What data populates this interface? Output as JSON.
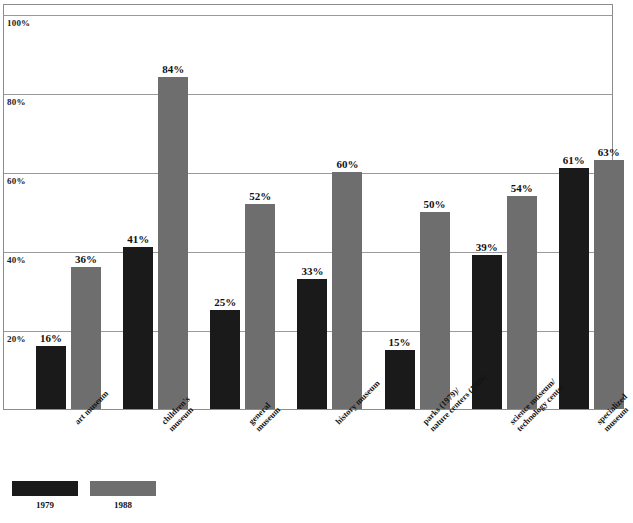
{
  "chart_data": {
    "type": "bar",
    "title": "",
    "xlabel": "",
    "ylabel": "",
    "ylim": [
      0,
      100
    ],
    "grid": true,
    "legend_position": "bottom-left",
    "y_ticks": [
      "20%",
      "40%",
      "60%",
      "80%",
      "100%"
    ],
    "y_tick_values": [
      20,
      40,
      60,
      80,
      100
    ],
    "categories": [
      "art museum",
      "children's\nmuseum",
      "general\nmuseum",
      "history museum",
      "parks (1979)/\nnature centers (1989)",
      "science museum/\ntechnology center",
      "specialized\nmuseum"
    ],
    "category_lines": [
      [
        "art museum"
      ],
      [
        "children's",
        "museum"
      ],
      [
        "general",
        "museum"
      ],
      [
        "history museum"
      ],
      [
        "parks (1979)/",
        "nature centers (1989)"
      ],
      [
        "science museum/",
        "technology center"
      ],
      [
        "specialized",
        "museum"
      ]
    ],
    "series": [
      {
        "name": "1979",
        "color": "#1a1a1a",
        "values": [
          16,
          41,
          25,
          33,
          15,
          39,
          61
        ],
        "labels": [
          "16%",
          "41%",
          "25%",
          "33%",
          "15%",
          "39%",
          "61%"
        ]
      },
      {
        "name": "1988",
        "color": "#6e6e6e",
        "values": [
          36,
          84,
          52,
          60,
          50,
          54,
          63
        ],
        "labels": [
          "36%",
          "84%",
          "52%",
          "60%",
          "50%",
          "54%",
          "63%"
        ]
      }
    ]
  },
  "legend": {
    "items": [
      {
        "label": "1979",
        "color": "#1a1a1a"
      },
      {
        "label": "1988",
        "color": "#6e6e6e"
      }
    ]
  }
}
